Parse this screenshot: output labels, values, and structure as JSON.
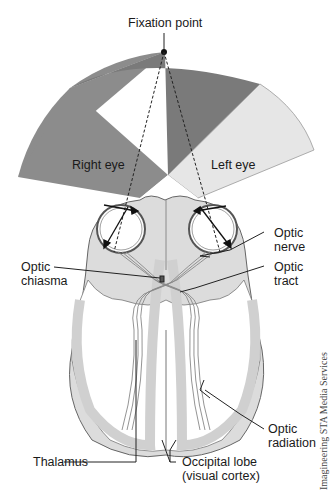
{
  "diagram": {
    "labels": {
      "fixation_point": "Fixation point",
      "right_eye": "Right eye",
      "left_eye": "Left eye",
      "optic_nerve_line1": "Optic",
      "optic_nerve_line2": "nerve",
      "optic_chiasma_line1": "Optic",
      "optic_chiasma_line2": "chiasma",
      "optic_tract_line1": "Optic",
      "optic_tract_line2": "tract",
      "optic_radiation_line1": "Optic",
      "optic_radiation_line2": "radiation",
      "thalamus": "Thalamus",
      "occipital_lobe_line1": "Occipital lobe",
      "occipital_lobe_line2": "(visual cortex)"
    },
    "credit": "Imagineering STA Media Services",
    "colors": {
      "right_eye_field": "#8c8c8c",
      "overlap_field": "#7a7a7a",
      "left_eye_field": "#e6e6e6",
      "brain_fill": "#d9d9d9",
      "outline": "#555555",
      "text": "#1a1a1a"
    }
  }
}
